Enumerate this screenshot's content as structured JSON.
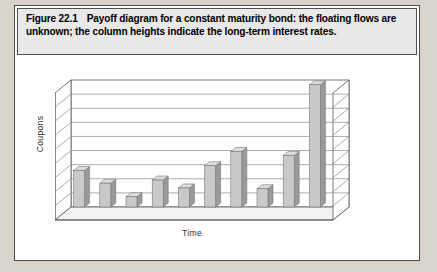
{
  "figure": {
    "label": "Figure 22.1",
    "caption": "Payoff diagram for a constant maturity bond: the floating flows are unknown; the column heights indicate the long-term interest rates."
  },
  "colors": {
    "page_background": "#d8d4cc",
    "figure_background": "#ffffff",
    "caption_background": "#e9e9e9",
    "border": "#4a4a4a",
    "bar_front": "#c9c9c9",
    "bar_side": "#9a9a9a",
    "bar_top": "#dcdcdc",
    "gridline": "#8a8a8a",
    "wall": "#ffffff",
    "floor": "#f2f2f2"
  },
  "chart_data": {
    "type": "bar",
    "title": "",
    "xlabel": "Time",
    "ylabel": "Coupons",
    "grid": true,
    "legend": "none",
    "three_d": true,
    "ylim": [
      0,
      8
    ],
    "gridline_count": 8,
    "tick_labels_visible": false,
    "categories": [
      "1",
      "2",
      "3",
      "4",
      "5",
      "6",
      "7",
      "8",
      "9",
      "10"
    ],
    "values": [
      2.3,
      1.5,
      0.65,
      1.7,
      1.2,
      2.6,
      3.5,
      1.15,
      3.25,
      7.7
    ],
    "series": [
      {
        "name": "Coupons",
        "values": [
          2.3,
          1.5,
          0.65,
          1.7,
          1.2,
          2.6,
          3.5,
          1.15,
          3.25,
          7.7
        ]
      }
    ]
  }
}
